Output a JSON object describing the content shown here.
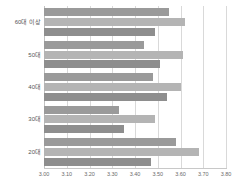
{
  "chart_data": {
    "type": "bar",
    "orientation": "horizontal",
    "title": "",
    "subtitle": "",
    "xlabel": "",
    "ylabel": "",
    "xlim": [
      3.0,
      3.8
    ],
    "ylim": null,
    "grid": true,
    "grid_axis": "x",
    "legend_visible": false,
    "legend_position": "none",
    "categories": [
      "60대 이상",
      "50대",
      "40대",
      "30대",
      "20대"
    ],
    "xticks": [
      3.0,
      3.1,
      3.2,
      3.3,
      3.4,
      3.5,
      3.6,
      3.7,
      3.8
    ],
    "xticklabels": [
      "3.00",
      "3.10",
      "3.20",
      "3.30",
      "3.40",
      "3.50",
      "3.60",
      "3.70",
      "3.80"
    ],
    "series": [
      {
        "name": "series-1",
        "color": "#9a9a9a",
        "values": [
          3.55,
          3.44,
          3.48,
          3.33,
          3.58
        ]
      },
      {
        "name": "series-2",
        "color": "#b4b4b4",
        "values": [
          3.62,
          3.61,
          3.6,
          3.49,
          3.68
        ]
      },
      {
        "name": "series-3",
        "color": "#8e8e8e",
        "values": [
          3.49,
          3.51,
          3.54,
          3.35,
          3.47
        ]
      }
    ]
  },
  "colors": {
    "gridline": "#d9d9d9",
    "axis": "#c8c8c8",
    "tick_text": "#6b6b6b",
    "category_text": "#555555",
    "background": "#ffffff"
  }
}
